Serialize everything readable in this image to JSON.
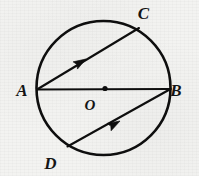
{
  "figure": {
    "title": "Circle with center O, diameter AB and two parallel chords AC and DB",
    "background_color": "#f3f3f1",
    "ink_color": "#0e0e0e",
    "labels": {
      "a": "A",
      "b": "B",
      "c": "C",
      "d": "D",
      "o": "O"
    },
    "geometry": {
      "circle": {
        "cx": 103.5,
        "cy": 88.0,
        "r": 67.0,
        "stroke_width": 2.6
      },
      "center_dot": {
        "cx": 105.0,
        "cy": 88.5,
        "r": 2.6
      },
      "points": {
        "A": {
          "x": 37.0,
          "y": 89.5
        },
        "B": {
          "x": 170.5,
          "y": 89.0
        },
        "C": {
          "x": 139.0,
          "y": 28.0
        },
        "D": {
          "x": 67.5,
          "y": 146.5
        },
        "O": {
          "x": 105.0,
          "y": 88.5
        }
      },
      "segments": [
        {
          "name": "diameter-ab",
          "from": "A",
          "to": "B",
          "arrow": false
        },
        {
          "name": "chord-ac",
          "from": "A",
          "to": "C",
          "arrow": true,
          "arrow_at": {
            "x": 86.0,
            "y": 59.0
          },
          "arrow_angle_deg": -52
        },
        {
          "name": "chord-db",
          "from": "D",
          "to": "B",
          "arrow": true,
          "arrow_at": {
            "x": 120.0,
            "y": 121.0
          },
          "arrow_angle_deg": -28
        }
      ],
      "label_positions": {
        "A": {
          "x": 22.0,
          "y": 96.0
        },
        "B": {
          "x": 176.0,
          "y": 96.0
        },
        "C": {
          "x": 143.5,
          "y": 19.0
        },
        "D": {
          "x": 50.5,
          "y": 169.0
        },
        "O": {
          "x": 90.0,
          "y": 110.0
        }
      }
    }
  }
}
